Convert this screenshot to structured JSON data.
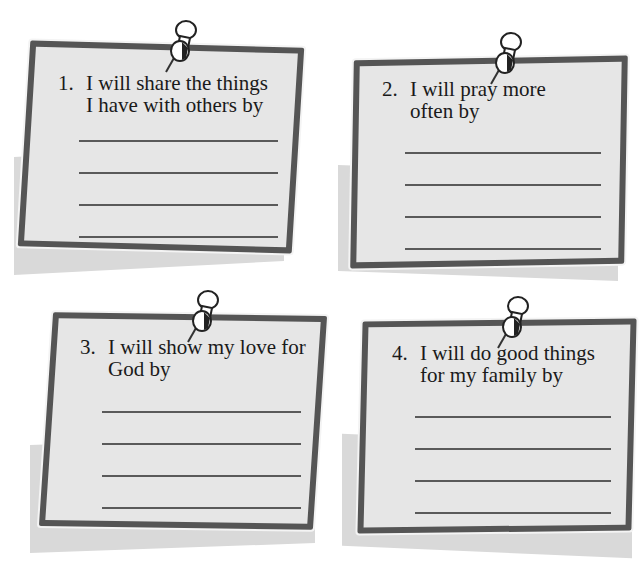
{
  "notes": [
    {
      "number": "1.",
      "line1": "I will share the things",
      "line2": "I have with others by",
      "answer_lines": 4
    },
    {
      "number": "2.",
      "line1": "I will pray more",
      "line2": "often by",
      "answer_lines": 4
    },
    {
      "number": "3.",
      "line1": "I will show my love for",
      "line2": "God by",
      "answer_lines": 4
    },
    {
      "number": "4.",
      "line1": "I will do good things",
      "line2": "for my family by",
      "answer_lines": 4
    }
  ],
  "colors": {
    "note_fill": "#e6e6e6",
    "note_border": "#555555",
    "shadow": "#d9d9d9",
    "text": "#1a1a1a"
  },
  "icons": {
    "pin": "pushpin-icon"
  }
}
